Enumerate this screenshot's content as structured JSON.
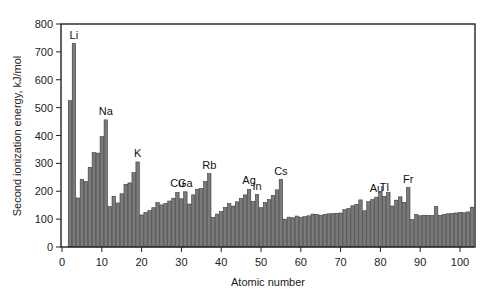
{
  "chart_data": {
    "type": "bar",
    "title": "",
    "xlabel": "Atomic number",
    "ylabel": "Second ionization energy, kJ/mol",
    "xlim": [
      0,
      104
    ],
    "ylim": [
      0,
      800
    ],
    "xticks": [
      0,
      10,
      20,
      30,
      40,
      50,
      60,
      70,
      80,
      90,
      100
    ],
    "yticks": [
      0,
      100,
      200,
      300,
      400,
      500,
      600,
      700,
      800
    ],
    "grid": false,
    "legend": null,
    "x": [
      2,
      3,
      4,
      5,
      6,
      7,
      8,
      9,
      10,
      11,
      12,
      13,
      14,
      15,
      16,
      17,
      18,
      19,
      20,
      21,
      22,
      23,
      24,
      25,
      26,
      27,
      28,
      29,
      30,
      31,
      32,
      33,
      34,
      35,
      36,
      37,
      38,
      39,
      40,
      41,
      42,
      43,
      44,
      45,
      46,
      47,
      48,
      49,
      50,
      51,
      52,
      53,
      54,
      55,
      56,
      57,
      58,
      59,
      60,
      61,
      62,
      63,
      64,
      65,
      66,
      67,
      68,
      69,
      70,
      71,
      72,
      73,
      74,
      75,
      76,
      77,
      78,
      79,
      80,
      81,
      82,
      83,
      84,
      85,
      86,
      87,
      88,
      89,
      90,
      91,
      92,
      93,
      94,
      95,
      96,
      97,
      98,
      99,
      100,
      101,
      102,
      103
    ],
    "values": [
      525,
      730,
      176,
      243,
      235,
      286,
      339,
      337,
      396,
      456,
      145,
      182,
      158,
      191,
      225,
      230,
      267,
      305,
      115,
      124,
      131,
      141,
      159,
      151,
      156,
      165,
      175,
      196,
      173,
      198,
      154,
      187,
      207,
      210,
      235,
      263,
      106,
      118,
      127,
      142,
      156,
      147,
      162,
      174,
      187,
      207,
      163,
      188,
      141,
      160,
      170,
      185,
      205,
      242,
      100,
      107,
      105,
      111,
      107,
      109,
      112,
      118,
      117,
      114,
      117,
      119,
      120,
      121,
      122,
      134,
      138,
      148,
      153,
      169,
      130,
      163,
      170,
      179,
      196,
      182,
      195,
      147,
      168,
      180,
      160,
      213,
      98,
      117,
      112,
      114,
      113,
      113,
      145,
      113,
      116,
      119,
      120,
      122,
      124,
      123,
      126,
      143
    ],
    "annotations": [
      {
        "text": "Li",
        "x": 3
      },
      {
        "text": "Na",
        "x": 11
      },
      {
        "text": "K",
        "x": 19
      },
      {
        "text": "Cu",
        "x": 29
      },
      {
        "text": "Ga",
        "x": 31
      },
      {
        "text": "Rb",
        "x": 37
      },
      {
        "text": "Ag",
        "x": 47
      },
      {
        "text": "In",
        "x": 49
      },
      {
        "text": "Cs",
        "x": 55
      },
      {
        "text": "Au",
        "x": 79
      },
      {
        "text": "Tl",
        "x": 81
      },
      {
        "text": "Fr",
        "x": 87
      }
    ]
  },
  "axes": {
    "xlabel": "Atomic number",
    "ylabel": "Second ionization energy, kJ/mol"
  }
}
